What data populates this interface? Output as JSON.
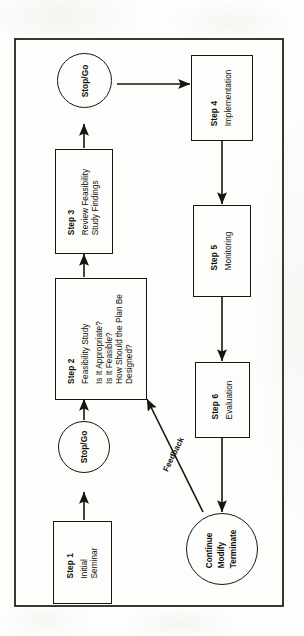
{
  "diagram": {
    "orientation": "rotated-90-ccw",
    "frame": {
      "name": "outer-border"
    },
    "nodes": [
      {
        "id": "step1",
        "shape": "rectangle",
        "step": "Step 1",
        "lines": [
          "Initial",
          "Seminar"
        ]
      },
      {
        "id": "decision1",
        "shape": "circle",
        "label": "Stop/Go"
      },
      {
        "id": "step2",
        "shape": "rectangle",
        "step": "Step 2",
        "lines": [
          "Feasibility Study"
        ],
        "questions": [
          "Is It Appropriate?",
          "Is It Feasible?",
          "How Should the Plan Be",
          "Designed?"
        ]
      },
      {
        "id": "step3",
        "shape": "rectangle",
        "step": "Step 3",
        "lines": [
          "Review Feasibility",
          "Study Findings"
        ]
      },
      {
        "id": "decision2",
        "shape": "circle",
        "label": "Stop/Go"
      },
      {
        "id": "step4",
        "shape": "rectangle",
        "step": "Step 4",
        "lines": [
          "Implementation"
        ]
      },
      {
        "id": "step5",
        "shape": "rectangle",
        "step": "Step 5",
        "lines": [
          "Monitoring"
        ]
      },
      {
        "id": "step6",
        "shape": "rectangle",
        "step": "Step 6",
        "lines": [
          "Evaluation"
        ]
      },
      {
        "id": "outcome",
        "shape": "circle",
        "options": [
          "Continue",
          "Modify",
          "Terminate"
        ]
      }
    ],
    "edges": [
      {
        "from": "step1",
        "to": "decision1",
        "label": ""
      },
      {
        "from": "decision1",
        "to": "step2",
        "label": ""
      },
      {
        "from": "step2",
        "to": "step3",
        "label": ""
      },
      {
        "from": "step3",
        "to": "decision2",
        "label": ""
      },
      {
        "from": "decision2",
        "to": "step4",
        "label": ""
      },
      {
        "from": "step4",
        "to": "step5",
        "label": ""
      },
      {
        "from": "step5",
        "to": "step6",
        "label": ""
      },
      {
        "from": "step6",
        "to": "outcome",
        "label": ""
      },
      {
        "from": "outcome",
        "to": "step2",
        "label": "Feedback"
      }
    ],
    "feedback_label": "Feedback",
    "colors": {
      "ink": "#16160f",
      "paper": "#fdfdfb"
    }
  }
}
